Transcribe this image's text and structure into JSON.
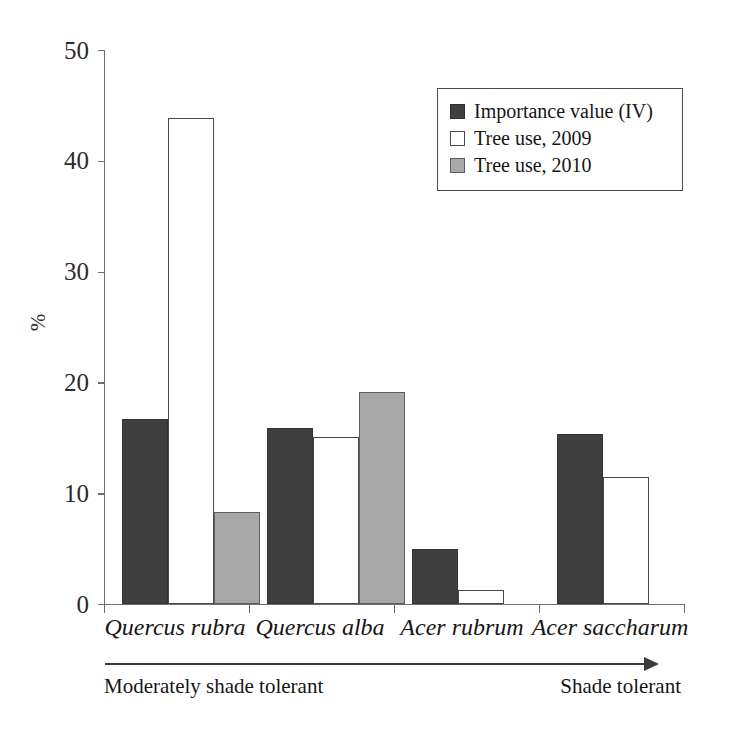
{
  "chart_data": {
    "type": "bar",
    "title": "",
    "xlabel": "",
    "ylabel": "%",
    "ylim": [
      0,
      50
    ],
    "yticks": [
      0,
      10,
      20,
      30,
      40,
      50
    ],
    "grid": false,
    "legend_position": "top-right",
    "categories": [
      "Quercus rubra",
      "Quercus alba",
      "Acer rubrum",
      "Acer saccharum"
    ],
    "series": [
      {
        "name": "Importance value (IV)",
        "color": "#3f3f3f",
        "values": [
          16.7,
          15.9,
          5.0,
          15.3
        ]
      },
      {
        "name": "Tree use, 2009",
        "color": "#ffffff",
        "values": [
          43.9,
          15.1,
          1.3,
          11.5
        ]
      },
      {
        "name": "Tree use, 2010",
        "color": "#a8a8a8",
        "values": [
          8.3,
          19.1,
          0,
          0
        ]
      }
    ],
    "annotations": {
      "gradient_left": "Moderately shade tolerant",
      "gradient_right": "Shade tolerant",
      "gradient_arrow": "arrow-right-icon"
    }
  },
  "axis": {
    "y_title": "%",
    "y_tick_labels": [
      "50",
      "40",
      "30",
      "20",
      "10",
      "0"
    ]
  },
  "legend": {
    "items": [
      {
        "label": "Importance value (IV)",
        "swatch": "filled-dark-square-icon"
      },
      {
        "label": "Tree use, 2009",
        "swatch": "empty-square-icon"
      },
      {
        "label": "Tree use, 2010",
        "swatch": "filled-gray-square-icon"
      }
    ]
  },
  "x_labels": [
    "Quercus rubra",
    "Quercus alba",
    "Acer rubrum",
    "Acer saccharum"
  ],
  "tolerance": {
    "left": "Moderately shade tolerant",
    "right": "Shade tolerant"
  }
}
